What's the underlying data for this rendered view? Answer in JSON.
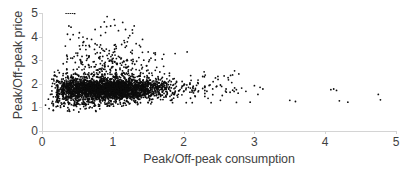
{
  "chart_data": {
    "type": "scatter",
    "title": "",
    "xlabel": "Peak/Off-peak consumption",
    "ylabel": "Peak/Off-peak price",
    "xlim": [
      0,
      5
    ],
    "ylim": [
      0,
      5
    ],
    "xticks": [
      0,
      1,
      2,
      3,
      4,
      5
    ],
    "yticks": [
      0,
      1,
      2,
      3,
      4,
      5
    ],
    "xtick_labels": [
      "0",
      "1",
      "2",
      "3",
      "4",
      "5"
    ],
    "ytick_labels": [
      "0",
      "1",
      "2",
      "3",
      "4",
      "5"
    ],
    "grid": false,
    "legend": null,
    "marker": {
      "color": "#0d0d0d",
      "size": 1.8,
      "shape": "circle"
    },
    "axis_color": "#d4d4d4",
    "series": [
      {
        "name": "observations",
        "n_points": 3600,
        "description": "Dense horizontal band of points centred near price 1.8 spanning consumption 0.15-2.0, with an upward-fanning tail reaching price 5 around consumption 0.3-1.5, plus sparse outliers out to consumption 4.8.",
        "clusters": [
          {
            "n": 1500,
            "x_mean": 0.95,
            "x_sd": 0.3,
            "y_mean": 1.78,
            "y_sd": 0.2,
            "x_min": 0.3,
            "x_max": 1.75,
            "y_min": 1.15,
            "y_max": 2.45
          },
          {
            "n": 760,
            "x_mean": 0.8,
            "x_sd": 0.34,
            "y_mean": 1.7,
            "y_sd": 0.28,
            "x_min": 0.22,
            "x_max": 1.7,
            "y_min": 1.05,
            "y_max": 2.6
          },
          {
            "n": 420,
            "x_mean": 1.3,
            "x_sd": 0.26,
            "y_mean": 1.8,
            "y_sd": 0.23,
            "x_min": 0.7,
            "x_max": 1.95,
            "y_min": 1.15,
            "y_max": 2.55
          },
          {
            "n": 300,
            "x_mean": 0.42,
            "x_sd": 0.13,
            "y_mean": 1.8,
            "y_sd": 0.33,
            "x_min": 0.14,
            "x_max": 0.8,
            "y_min": 0.85,
            "y_max": 2.8
          },
          {
            "n": 240,
            "x_mean": 1.05,
            "x_sd": 0.34,
            "y_mean": 2.45,
            "y_sd": 0.42,
            "x_min": 0.35,
            "x_max": 1.8,
            "y_min": 1.8,
            "y_max": 4.2
          },
          {
            "n": 120,
            "x_mean": 0.95,
            "x_sd": 0.32,
            "y_mean": 3.2,
            "y_sd": 0.55,
            "x_min": 0.35,
            "x_max": 1.6,
            "y_min": 2.4,
            "y_max": 4.9
          },
          {
            "n": 70,
            "x_mean": 0.55,
            "x_sd": 0.22,
            "y_mean": 1.15,
            "y_sd": 0.18,
            "x_min": 0.16,
            "x_max": 1.25,
            "y_min": 0.8,
            "y_max": 1.45
          },
          {
            "n": 110,
            "x_mean": 1.85,
            "x_sd": 0.22,
            "y_mean": 1.75,
            "y_sd": 0.25,
            "x_min": 1.5,
            "x_max": 2.3,
            "y_min": 1.2,
            "y_max": 2.5
          },
          {
            "n": 45,
            "x_mean": 2.35,
            "x_sd": 0.28,
            "y_mean": 1.8,
            "y_sd": 0.3,
            "x_min": 2.0,
            "x_max": 2.95,
            "y_min": 1.2,
            "y_max": 2.6
          }
        ],
        "outliers": [
          [
            0.05,
            1.1
          ],
          [
            0.09,
            1.35
          ],
          [
            0.12,
            1.55
          ],
          [
            0.1,
            0.95
          ],
          [
            0.15,
            1.25
          ],
          [
            0.18,
            2.0
          ],
          [
            0.14,
            1.7
          ],
          [
            0.21,
            2.3
          ],
          [
            0.16,
            0.88
          ],
          [
            0.22,
            1.05
          ],
          [
            0.34,
            5.0
          ],
          [
            0.37,
            5.0
          ],
          [
            0.4,
            5.0
          ],
          [
            0.43,
            5.0
          ],
          [
            0.46,
            4.98
          ],
          [
            0.38,
            4.45
          ],
          [
            0.41,
            4.4
          ],
          [
            0.36,
            4.1
          ],
          [
            0.44,
            4.08
          ],
          [
            0.33,
            3.6
          ],
          [
            0.52,
            3.95
          ],
          [
            0.58,
            3.75
          ],
          [
            0.48,
            3.3
          ],
          [
            0.62,
            3.45
          ],
          [
            0.7,
            3.88
          ],
          [
            0.75,
            4.3
          ],
          [
            0.83,
            4.05
          ],
          [
            0.88,
            4.62
          ],
          [
            0.92,
            4.85
          ],
          [
            0.97,
            4.45
          ],
          [
            1.02,
            4.72
          ],
          [
            1.08,
            4.25
          ],
          [
            1.14,
            4.6
          ],
          [
            1.18,
            4.3
          ],
          [
            1.22,
            3.95
          ],
          [
            1.28,
            4.15
          ],
          [
            1.33,
            3.7
          ],
          [
            1.42,
            3.88
          ],
          [
            1.5,
            3.35
          ],
          [
            1.58,
            3.3
          ],
          [
            1.72,
            3.25
          ],
          [
            1.88,
            3.28
          ],
          [
            2.05,
            3.35
          ],
          [
            2.1,
            2.35
          ],
          [
            2.2,
            2.05
          ],
          [
            2.3,
            1.9
          ],
          [
            2.45,
            2.25
          ],
          [
            2.52,
            1.95
          ],
          [
            2.6,
            1.78
          ],
          [
            2.68,
            2.05
          ],
          [
            2.72,
            2.55
          ],
          [
            2.78,
            2.42
          ],
          [
            2.82,
            1.82
          ],
          [
            2.88,
            1.68
          ],
          [
            2.94,
            1.22
          ],
          [
            3.0,
            1.92
          ],
          [
            3.05,
            1.55
          ],
          [
            3.08,
            1.85
          ],
          [
            3.12,
            1.78
          ],
          [
            2.52,
            1.3
          ],
          [
            3.5,
            1.3
          ],
          [
            3.58,
            1.25
          ],
          [
            4.08,
            1.75
          ],
          [
            4.12,
            1.78
          ],
          [
            4.16,
            1.72
          ],
          [
            4.2,
            1.28
          ],
          [
            4.32,
            1.22
          ],
          [
            4.75,
            1.55
          ],
          [
            4.78,
            1.32
          ],
          [
            0.92,
            1.05
          ],
          [
            1.15,
            1.08
          ],
          [
            1.35,
            1.12
          ],
          [
            0.68,
            1.02
          ],
          [
            1.55,
            1.22
          ],
          [
            0.3,
            2.85
          ],
          [
            0.36,
            3.05
          ],
          [
            0.55,
            2.95
          ],
          [
            1.62,
            2.7
          ],
          [
            1.8,
            2.45
          ]
        ]
      }
    ]
  }
}
